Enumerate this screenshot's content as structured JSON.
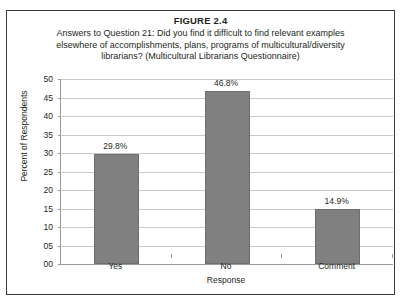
{
  "figure": {
    "title": "FIGURE 2.4",
    "subtitle_lines": [
      "Answers to Question 21: Did you find it difficult to find relevant examples",
      "elsewhere of accomplishments, plans, programs of multicultural/diversity",
      "librarians? (Multicultural Librarians Questionnaire)"
    ],
    "border_color": "#3a3a3a"
  },
  "chart_data": {
    "type": "bar",
    "categories": [
      "Yes",
      "No",
      "Comment"
    ],
    "values": [
      29.8,
      46.8,
      14.9
    ],
    "data_labels": [
      "29.8%",
      "46.8%",
      "14.9%"
    ],
    "xlabel": "Response",
    "ylabel": "Percent of Respondents",
    "ylim": [
      0,
      50
    ],
    "ytick_values": [
      0,
      5,
      10,
      15,
      20,
      25,
      30,
      35,
      40,
      45,
      50
    ],
    "ytick_labels": [
      "00",
      "05",
      "10",
      "15",
      "20",
      "25",
      "30",
      "35",
      "40",
      "45",
      "50"
    ],
    "grid": true,
    "legend": false,
    "bar_color": "#808080",
    "bar_border_color": "#6e6e6e",
    "gridline_color": "#c9c9c9",
    "axis_color": "#9a9a9a"
  }
}
